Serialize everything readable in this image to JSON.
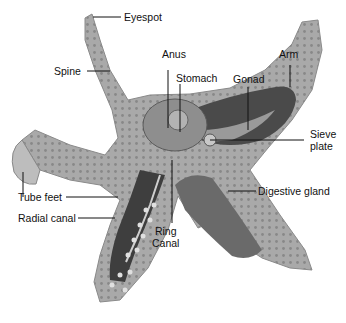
{
  "diagram": {
    "colors": {
      "body": "#a8a8a8",
      "body_dark": "#7c7c7c",
      "cavity": "#4a4a4a",
      "line": "#111111",
      "background": "#ffffff"
    },
    "labels": [
      {
        "id": "eyespot",
        "text": "Eyespot"
      },
      {
        "id": "spine",
        "text": "Spine"
      },
      {
        "id": "anus",
        "text": "Anus"
      },
      {
        "id": "arm",
        "text": "Arm"
      },
      {
        "id": "stomach",
        "text": "Stomach"
      },
      {
        "id": "gonad",
        "text": "Gonad"
      },
      {
        "id": "sieve-plate",
        "text": "Sieve\nplate"
      },
      {
        "id": "digestive-gland",
        "text": "Digestive gland"
      },
      {
        "id": "tube-feet",
        "text": "Tube feet"
      },
      {
        "id": "radial-canal",
        "text": "Radial canal"
      },
      {
        "id": "ring-canal",
        "text": "Ring\nCanal"
      }
    ]
  }
}
